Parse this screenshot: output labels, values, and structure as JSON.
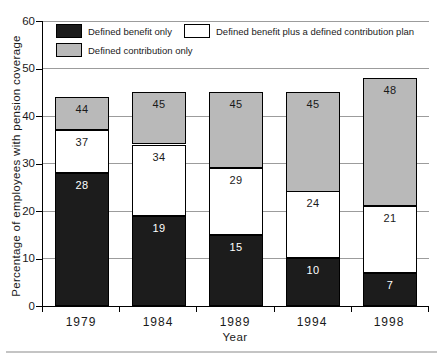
{
  "chart_data": {
    "type": "bar",
    "stacked": true,
    "title": "",
    "xlabel": "Year",
    "ylabel": "Percentage of employees with pension coverage",
    "categories": [
      "1979",
      "1984",
      "1989",
      "1994",
      "1998"
    ],
    "series": [
      {
        "name": "Defined benefit only",
        "color": "#1c1c1c",
        "label_color": "#ffffff",
        "cumulative_values": [
          28,
          19,
          15,
          10,
          7
        ],
        "segment_values": [
          28,
          19,
          15,
          10,
          7
        ]
      },
      {
        "name": "Defined benefit plus a defined contribution plan",
        "color": "#ffffff",
        "label_color": "#1a1a1a",
        "cumulative_values": [
          37,
          34,
          29,
          24,
          21
        ],
        "segment_values": [
          9,
          15,
          14,
          14,
          14
        ]
      },
      {
        "name": "Defined contribution only",
        "color": "#b9b9b9",
        "label_color": "#1a1a1a",
        "cumulative_values": [
          44,
          45,
          45,
          45,
          48
        ],
        "segment_values": [
          7,
          11,
          16,
          21,
          27
        ]
      }
    ],
    "ylim": [
      0,
      60
    ],
    "yticks": [
      0,
      10,
      20,
      30,
      40,
      50,
      60
    ],
    "grid": "horizontal",
    "legend_position": "top-left",
    "bar_labels": "cumulative totals printed inside each segment"
  },
  "colors": {
    "background": "#ffffff",
    "axis": "#000000",
    "gridline": "#9c9c9c",
    "segment_border": "#000000",
    "bar_black": "#1c1c1c",
    "bar_white": "#ffffff",
    "bar_gray": "#b9b9b9",
    "separator": "#c4c4c4"
  }
}
